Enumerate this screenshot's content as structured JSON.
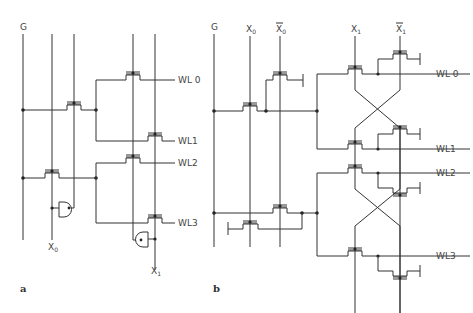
{
  "figure": {
    "panel_a": {
      "label": "a",
      "inputs": {
        "g": "G",
        "x0": "X",
        "x0_sub": "0",
        "x1": "X",
        "x1_sub": "1"
      },
      "word_lines": [
        "WL 0",
        "WL1",
        "WL2",
        "WL3"
      ]
    },
    "panel_b": {
      "label": "b",
      "inputs": {
        "g": "G",
        "x0": "X",
        "x0_sub": "0",
        "x0bar": "X",
        "x0bar_sub": "0",
        "x1": "X",
        "x1_sub": "1",
        "x1bar": "X",
        "x1bar_sub": "1"
      },
      "word_lines": [
        "WL 0",
        "WL1",
        "WL2",
        "WL3"
      ]
    }
  }
}
